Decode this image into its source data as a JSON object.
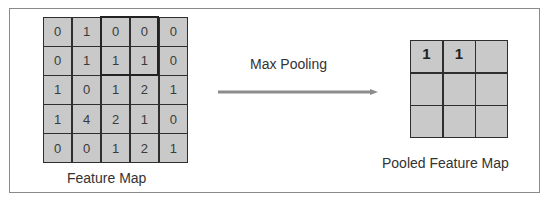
{
  "diagram": {
    "feature_map": {
      "label": "Feature Map",
      "rows": [
        [
          "0",
          "1",
          "0",
          "0",
          "0"
        ],
        [
          "0",
          "1",
          "1",
          "1",
          "0"
        ],
        [
          "1",
          "0",
          "1",
          "2",
          "1"
        ],
        [
          "1",
          "4",
          "2",
          "1",
          "0"
        ],
        [
          "0",
          "0",
          "1",
          "2",
          "1"
        ]
      ],
      "highlighted_window": {
        "rows": [
          0,
          1
        ],
        "cols": [
          2,
          3
        ]
      }
    },
    "operation": {
      "label": "Max Pooling",
      "arrow_color": "#8c8c8c"
    },
    "pooled_map": {
      "label": "Pooled Feature Map",
      "rows": [
        [
          "1",
          "1",
          ""
        ],
        [
          "",
          "",
          ""
        ],
        [
          "",
          "",
          ""
        ]
      ]
    },
    "colors": {
      "cell_fill": "#c9c9c9",
      "grid_line": "#2e2e2e",
      "frame_border": "#8a8a8a"
    }
  }
}
